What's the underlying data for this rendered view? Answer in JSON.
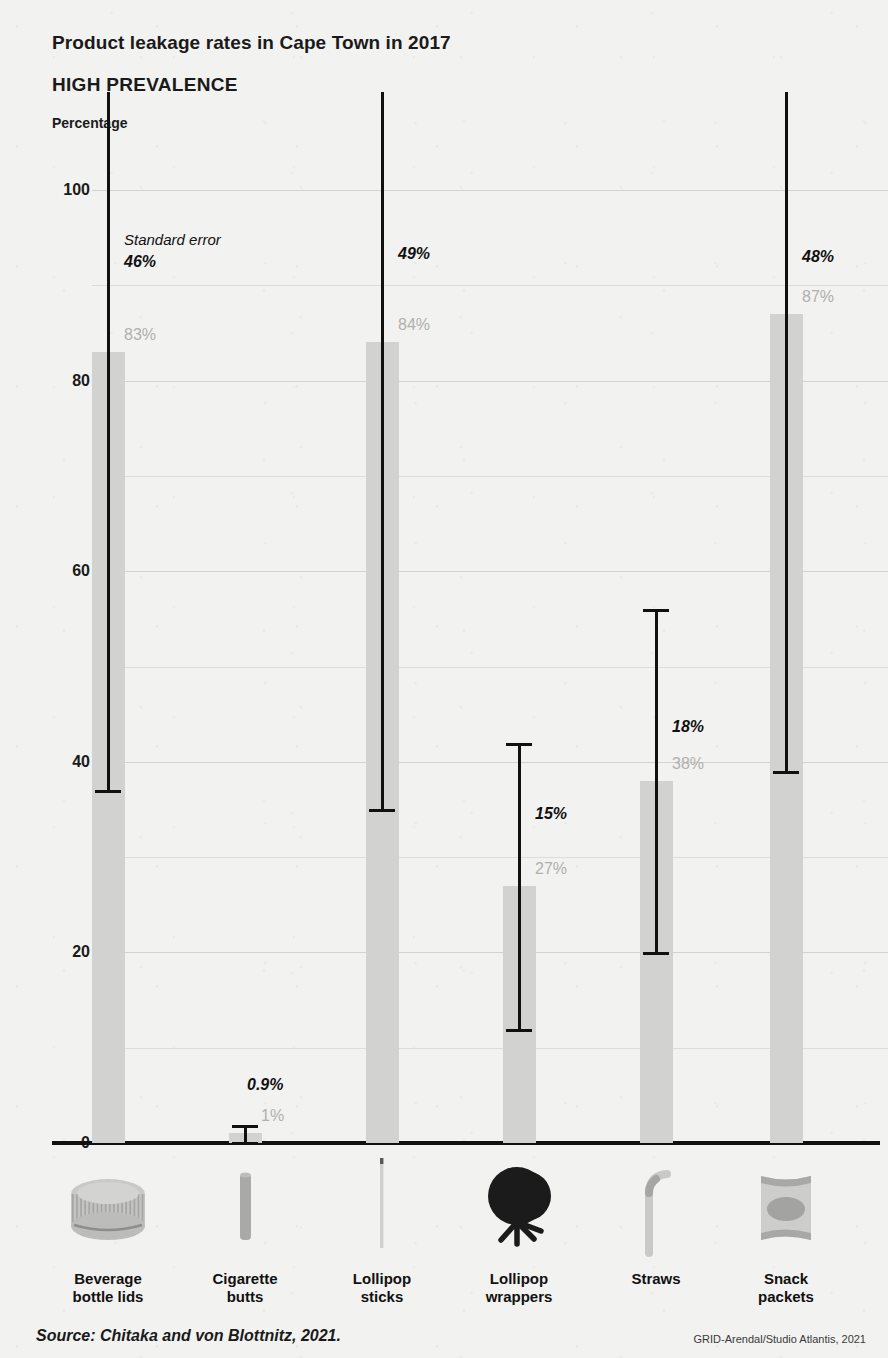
{
  "header": {
    "title": "Product leakage rates in Cape Town in 2017",
    "subtitle": "HIGH PREVALENCE",
    "axis_label": "Percentage"
  },
  "annotations": {
    "standard_error_note": "Standard error",
    "source": "Source: Chitaka and von Blottnitz, 2021.",
    "credit": "GRID-Arendal/Studio Atlantis, 2021"
  },
  "colors": {
    "bar": "#d2d2d0",
    "error_bar": "#111111",
    "value_label": "#b0b0ae",
    "se_label": "#111111",
    "background": "#f2f2f0",
    "gridline": "#dcdcda",
    "baseline": "#111111"
  },
  "chart_data": {
    "type": "bar",
    "title": "Product leakage rates in Cape Town in 2017",
    "subtitle": "HIGH PREVALENCE",
    "xlabel": "",
    "ylabel": "Percentage",
    "ylim": [
      0,
      100
    ],
    "yticks": [
      0,
      20,
      40,
      60,
      80,
      100
    ],
    "ytick_labels": [
      "0",
      "20",
      "40",
      "60",
      "80",
      "100"
    ],
    "gridlines": [
      10,
      20,
      30,
      40,
      50,
      60,
      70,
      80,
      90,
      100
    ],
    "grid": true,
    "legend": "none",
    "error_bar_type": "standard error",
    "categories": [
      "Beverage\nbottle lids",
      "Cigarette\nbutts",
      "Lollipop\nsticks",
      "Lollipop\nwrappers",
      "Straws",
      "Snack\npackets"
    ],
    "values": [
      83,
      1,
      84,
      27,
      38,
      87
    ],
    "value_labels": [
      "83%",
      "1%",
      "84%",
      "27%",
      "38%",
      "87%"
    ],
    "errors": [
      46,
      0.9,
      49,
      15,
      18,
      48
    ],
    "error_labels": [
      "46%",
      "0.9%",
      "49%",
      "15%",
      "18%",
      "48%"
    ],
    "icons": [
      "bottle-cap-icon",
      "cigarette-butt-icon",
      "lollipop-stick-icon",
      "lollipop-wrapper-icon",
      "straw-icon",
      "snack-packet-icon"
    ]
  }
}
